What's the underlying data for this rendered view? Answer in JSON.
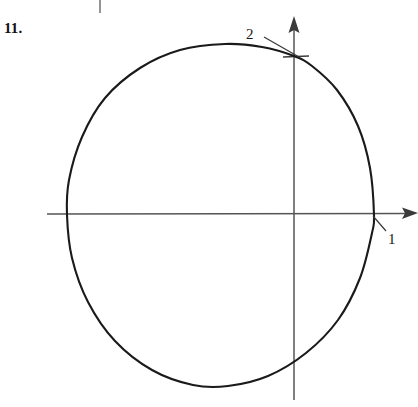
{
  "figure": {
    "problem_number": "11.",
    "background_color": "#ffffff",
    "ink_color": "#111111",
    "axis_color": "#555555",
    "curve_color": "#1a1a1a"
  },
  "labels": {
    "y_intercept": "2",
    "x_intercept": "1"
  },
  "chart_data": {
    "type": "line",
    "title": "",
    "subtitle": "",
    "xlabel": "",
    "ylabel": "",
    "grid": false,
    "legend": null,
    "axes": {
      "x_axis": {
        "label": "",
        "origin_px": [
          294,
          214
        ],
        "start_px": [
          47,
          214
        ],
        "end_px": [
          418,
          213
        ],
        "arrow": "end",
        "ticks": []
      },
      "y_axis": {
        "label": "",
        "origin_px": [
          294,
          214
        ],
        "start_px": [
          294,
          400
        ],
        "end_px": [
          294,
          16
        ],
        "arrow": "end",
        "ticks": [
          {
            "value": "2",
            "px": [
              294,
              56
            ],
            "mark": "horizontal-tick"
          }
        ]
      }
    },
    "curve": {
      "name": "closed-oval",
      "closed": true,
      "points_px": [
        [
          294,
          56
        ],
        [
          262,
          47
        ],
        [
          225,
          44
        ],
        [
          180,
          50
        ],
        [
          140,
          68
        ],
        [
          105,
          98
        ],
        [
          82,
          137
        ],
        [
          69,
          180
        ],
        [
          67,
          215
        ],
        [
          72,
          258
        ],
        [
          88,
          302
        ],
        [
          115,
          341
        ],
        [
          152,
          370
        ],
        [
          193,
          385
        ],
        [
          228,
          386
        ],
        [
          268,
          376
        ],
        [
          306,
          353
        ],
        [
          338,
          320
        ],
        [
          360,
          278
        ],
        [
          372,
          233
        ],
        [
          374,
          215
        ],
        [
          370,
          168
        ],
        [
          358,
          126
        ],
        [
          337,
          90
        ],
        [
          312,
          66
        ],
        [
          294,
          56
        ]
      ],
      "intercepts": [
        {
          "label": "2",
          "axis": "y",
          "px": [
            294,
            56
          ]
        },
        {
          "label": "1",
          "axis": "x",
          "px": [
            374,
            215
          ]
        }
      ]
    },
    "annotations": [
      {
        "text": "2",
        "text_px": [
          246,
          27
        ],
        "leader_from_px": [
          264,
          37
        ],
        "leader_to_px": [
          299,
          57
        ]
      },
      {
        "text": "1",
        "text_px": [
          388,
          232
        ],
        "leader_from_px": [
          386,
          231
        ],
        "leader_to_px": [
          373,
          216
        ]
      }
    ],
    "marks": [
      {
        "name": "scan-artifact-tick",
        "px": [
          100,
          0
        ],
        "length_px": 13,
        "orientation": "vertical"
      }
    ]
  }
}
